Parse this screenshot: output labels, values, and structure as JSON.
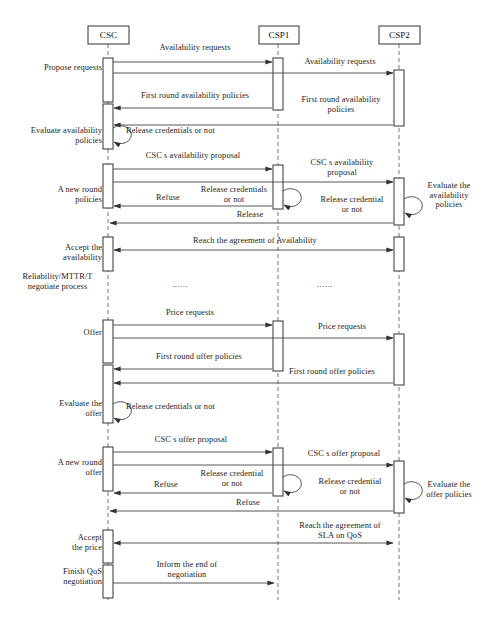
{
  "figure": {
    "caption": "",
    "width": 482,
    "height": 624,
    "background": "#ffffff",
    "line_color": "#333333",
    "box_fill": "#ffffff"
  },
  "lifelines": [
    {
      "id": "csc",
      "label": "CSC",
      "x": 108
    },
    {
      "id": "csp1",
      "label": "CSP1",
      "x": 278
    },
    {
      "id": "csp2",
      "label": "CSP2",
      "x": 399
    }
  ],
  "side_labels": [
    {
      "id": "propose-requests",
      "text": "Propose requests",
      "x": 58,
      "y": 68,
      "align": "right",
      "anchor_x": 102
    },
    {
      "id": "evaluate-availability",
      "text": "Evaluate availability\npolicies",
      "x": 56,
      "y": 131,
      "align": "right",
      "anchor_x": 102
    },
    {
      "id": "a-new-round-policies",
      "text": "A new round\npolicies",
      "x": 58,
      "y": 190,
      "align": "right",
      "anchor_x": 102
    },
    {
      "id": "accept-availability",
      "text": "Accept the\navailability",
      "x": 58,
      "y": 249,
      "align": "right",
      "anchor_x": 102
    },
    {
      "id": "reliability-mttr",
      "text": "Reliability/MTTR/T\nnegotiate process",
      "x": 18,
      "y": 277,
      "align": "left",
      "anchor_x": 102
    },
    {
      "id": "offer",
      "text": "Offer",
      "x": 58,
      "y": 330,
      "align": "right",
      "anchor_x": 102
    },
    {
      "id": "evaluate-the-offer",
      "text": "Evaluate the\noffer",
      "x": 58,
      "y": 404,
      "align": "right",
      "anchor_x": 102
    },
    {
      "id": "a-new-round-offer",
      "text": "A new round\noffer",
      "x": 58,
      "y": 463,
      "align": "right",
      "anchor_x": 102
    },
    {
      "id": "accept-the-price",
      "text": "Accept\nthe price",
      "x": 58,
      "y": 538,
      "align": "right",
      "anchor_x": 102
    },
    {
      "id": "finish-qos-negotiation",
      "text": "Finish QoS\nnegotiation",
      "x": 52,
      "y": 572,
      "align": "right",
      "anchor_x": 102
    },
    {
      "id": "evaluate-availability-policies-right",
      "text": "Evaluate the\navailability\npolicies",
      "x": 420,
      "y": 185,
      "align": "left",
      "anchor_x": 420
    },
    {
      "id": "evaluate-offer-policies-right",
      "text": "Evaluate the\noffer policies",
      "x": 420,
      "y": 484,
      "align": "left",
      "anchor_x": 420
    }
  ],
  "messages": [
    {
      "id": "availability-requests-1",
      "label": "Availability requests",
      "from": "csc",
      "to": "csp1",
      "y": 62,
      "label_y": 48,
      "dir": "right"
    },
    {
      "id": "availability-requests-2",
      "label": "Availability requests",
      "from": "csc",
      "to": "csp2",
      "y": 73,
      "label_y": 62,
      "dir": "right"
    },
    {
      "id": "first-round-avail-pol-1",
      "label": "First round availability policies",
      "from": "csp1",
      "to": "csc",
      "y": 108,
      "label_y": 96,
      "dir": "left"
    },
    {
      "id": "first-round-avail-pol-2",
      "label": "First round availability\npolicies",
      "from": "csp2",
      "to": "csc",
      "y": 125,
      "label_y": 100,
      "dir": "left"
    },
    {
      "id": "release-credentials-self-1",
      "label": "Release credentials or not",
      "from": "csc",
      "to": "csc",
      "y": 134,
      "label_y": 128,
      "dir": "self"
    },
    {
      "id": "csc-avail-proposal-1",
      "label": "CSC s availability proposal",
      "from": "csc",
      "to": "csp1",
      "y": 169,
      "label_y": 156,
      "dir": "right"
    },
    {
      "id": "csc-avail-proposal-2",
      "label": "CSC s availability\nproposal",
      "from": "csc",
      "to": "csp2",
      "y": 182,
      "label_y": 163,
      "dir": "right"
    },
    {
      "id": "release-credentials-self-2",
      "label": "Release credentials\nor not",
      "from": "csp1",
      "to": "csp1",
      "y": 197,
      "label_y": 190,
      "dir": "self"
    },
    {
      "id": "release-credential-self-3",
      "label": "Release credential\nor not",
      "from": "csp2",
      "to": "csp2",
      "y": 205,
      "label_y": 198,
      "dir": "self"
    },
    {
      "id": "refuse-1",
      "label": "Refuse",
      "from": "csp1",
      "to": "csc",
      "y": 206,
      "label_y": 197,
      "dir": "left"
    },
    {
      "id": "release-1",
      "label": "Release",
      "from": "csp2",
      "to": "csc",
      "y": 223,
      "label_y": 213,
      "dir": "left"
    },
    {
      "id": "reach-agreement-avail",
      "label": "Reach the agreement of Availability",
      "from": "csp2",
      "to": "csc",
      "y": 250,
      "label_y": 239,
      "dir": "both"
    },
    {
      "id": "price-requests-1",
      "label": "Price requests",
      "from": "csc",
      "to": "csp1",
      "y": 325,
      "label_y": 313,
      "dir": "right"
    },
    {
      "id": "price-requests-2",
      "label": "Price requests",
      "from": "csc",
      "to": "csp2",
      "y": 338,
      "label_y": 327,
      "dir": "right"
    },
    {
      "id": "first-round-offer-pol-1",
      "label": "First round offer policies",
      "from": "csp1",
      "to": "csc",
      "y": 369,
      "label_y": 357,
      "dir": "left"
    },
    {
      "id": "first-round-offer-pol-2",
      "label": "First round offer policies",
      "from": "csp2",
      "to": "csc",
      "y": 383,
      "label_y": 372,
      "dir": "left"
    },
    {
      "id": "release-credentials-self-4",
      "label": "Release credentials or not",
      "from": "csc",
      "to": "csc",
      "y": 410,
      "label_y": 404,
      "dir": "self"
    },
    {
      "id": "csc-offer-proposal-1",
      "label": "CSC s offer proposal",
      "from": "csc",
      "to": "csp1",
      "y": 452,
      "label_y": 440,
      "dir": "right"
    },
    {
      "id": "csc-offer-proposal-2",
      "label": "CSC s offer proposal",
      "from": "csc",
      "to": "csp2",
      "y": 465,
      "label_y": 454,
      "dir": "right"
    },
    {
      "id": "release-credential-self-5",
      "label": "Release credential\nor not",
      "from": "csp1",
      "to": "csp1",
      "y": 483,
      "label_y": 473,
      "dir": "self"
    },
    {
      "id": "release-credential-self-6",
      "label": "Release credential\nor not",
      "from": "csp2",
      "to": "csp2",
      "y": 490,
      "label_y": 480,
      "dir": "self"
    },
    {
      "id": "refuse-2",
      "label": "Refuse",
      "from": "csp1",
      "to": "csc",
      "y": 493,
      "label_y": 484,
      "dir": "left"
    },
    {
      "id": "refuse-3",
      "label": "Refuse",
      "from": "csp2",
      "to": "csc",
      "y": 511,
      "label_y": 501,
      "dir": "left"
    },
    {
      "id": "reach-agreement-sla",
      "label": "Reach the agreement of\nSLA on QoS",
      "from": "csp2",
      "to": "csc",
      "y": 543,
      "label_y": 524,
      "dir": "both"
    },
    {
      "id": "inform-end-negotiation",
      "label": "Inform the end of\nnegotiation",
      "from": "csc",
      "to": "csp1",
      "y": 583,
      "label_y": 563,
      "dir": "right"
    }
  ],
  "ellipses": [
    {
      "id": "ellipsis-left",
      "text": "......",
      "x": 180,
      "y": 285
    },
    {
      "id": "ellipsis-right",
      "text": "......",
      "x": 325,
      "y": 285
    }
  ]
}
